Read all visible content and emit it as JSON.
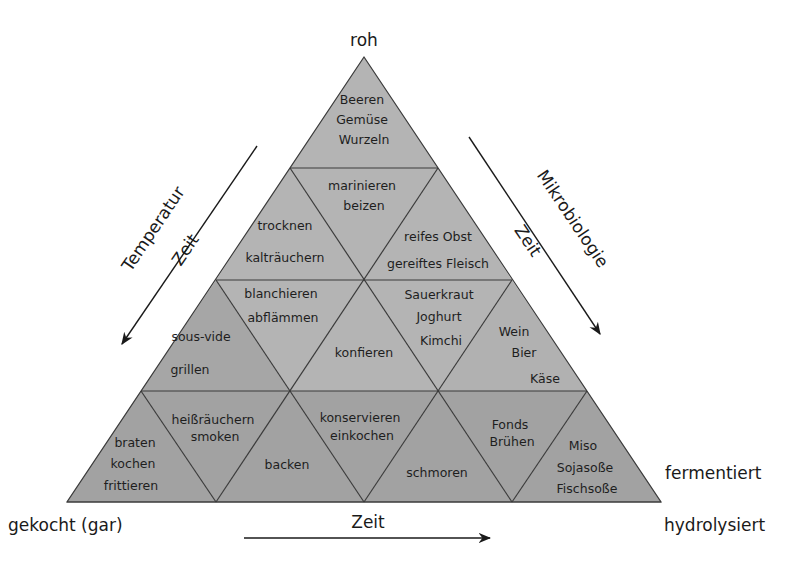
{
  "colors": {
    "light_fill": "#b4b4b4",
    "mid_fill": "#a9a9a9",
    "dark_fill": "#a1a1a1",
    "line": "#3a3a3a",
    "text": "#1e1e1e",
    "background": "#ffffff"
  },
  "corners": {
    "top": "roh",
    "bottom_left": "gekocht (gar)",
    "bottom_right_upper": "fermentiert",
    "bottom_right_lower": "hydrolysiert"
  },
  "axes": {
    "left": {
      "label_outer": "Temperatur",
      "label_inner": "Zeit",
      "direction": "down-left"
    },
    "right": {
      "label_outer": "Mikrobiologie",
      "label_inner": "Zeit",
      "direction": "down-right"
    },
    "bottom": {
      "label": "Zeit",
      "direction": "right"
    }
  },
  "cells": {
    "r1_top": [
      "Beeren",
      "Gemüse",
      "Wurzeln"
    ],
    "r2_left": [
      "trocknen",
      "kalträuchern"
    ],
    "r2_mid": [
      "marinieren",
      "beizen"
    ],
    "r2_right": [
      "reifes Obst",
      "gereiftes Fleisch"
    ],
    "r3_left": [
      "sous-vide",
      "grillen"
    ],
    "r3_inv_left": [
      "blanchieren",
      "abflämmen"
    ],
    "r3_mid": [
      "konfieren"
    ],
    "r3_inv_right": [
      "Sauerkraut",
      "Joghurt",
      "Kimchi"
    ],
    "r3_right": [
      "Wein",
      "Bier",
      "Käse"
    ],
    "r4_1": [
      "braten",
      "kochen",
      "frittieren"
    ],
    "r4_inv_1": [
      "heißräuchern",
      "smoken"
    ],
    "r4_2": [
      "backen"
    ],
    "r4_inv_2": [
      "konservieren",
      "einkochen"
    ],
    "r4_3": [
      "schmoren"
    ],
    "r4_inv_3": [
      "Fonds",
      "Brühen"
    ],
    "r4_4": [
      "Miso",
      "Sojasoße",
      "Fischsoße"
    ]
  }
}
